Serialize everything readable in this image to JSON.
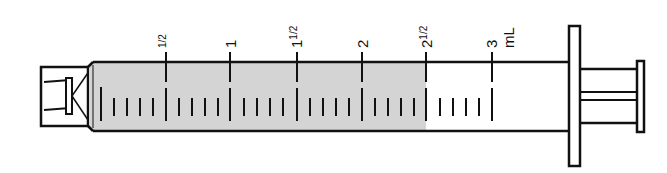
{
  "diagram": {
    "unit": "mL",
    "capacity_ml": 3,
    "fill_level_ml": 2.5,
    "colors": {
      "fill": "#d4d4d4",
      "outline": "#111111",
      "background": "#ffffff"
    },
    "scale": {
      "major_marks": [
        {
          "value": 0.5,
          "label_whole": "",
          "label_frac": "1/2"
        },
        {
          "value": 1,
          "label_whole": "1",
          "label_frac": ""
        },
        {
          "value": 1.5,
          "label_whole": "1",
          "label_frac": "1/2"
        },
        {
          "value": 2,
          "label_whole": "2",
          "label_frac": ""
        },
        {
          "value": 2.5,
          "label_whole": "2",
          "label_frac": "1/2"
        },
        {
          "value": 3,
          "label_whole": "3",
          "label_frac": ""
        }
      ],
      "minor_step_ml": 0.1,
      "unit_label": "mL"
    },
    "parts": [
      "tip-hub",
      "barrel",
      "graduations",
      "liquid",
      "flange",
      "plunger-rod",
      "thumb-press"
    ]
  }
}
